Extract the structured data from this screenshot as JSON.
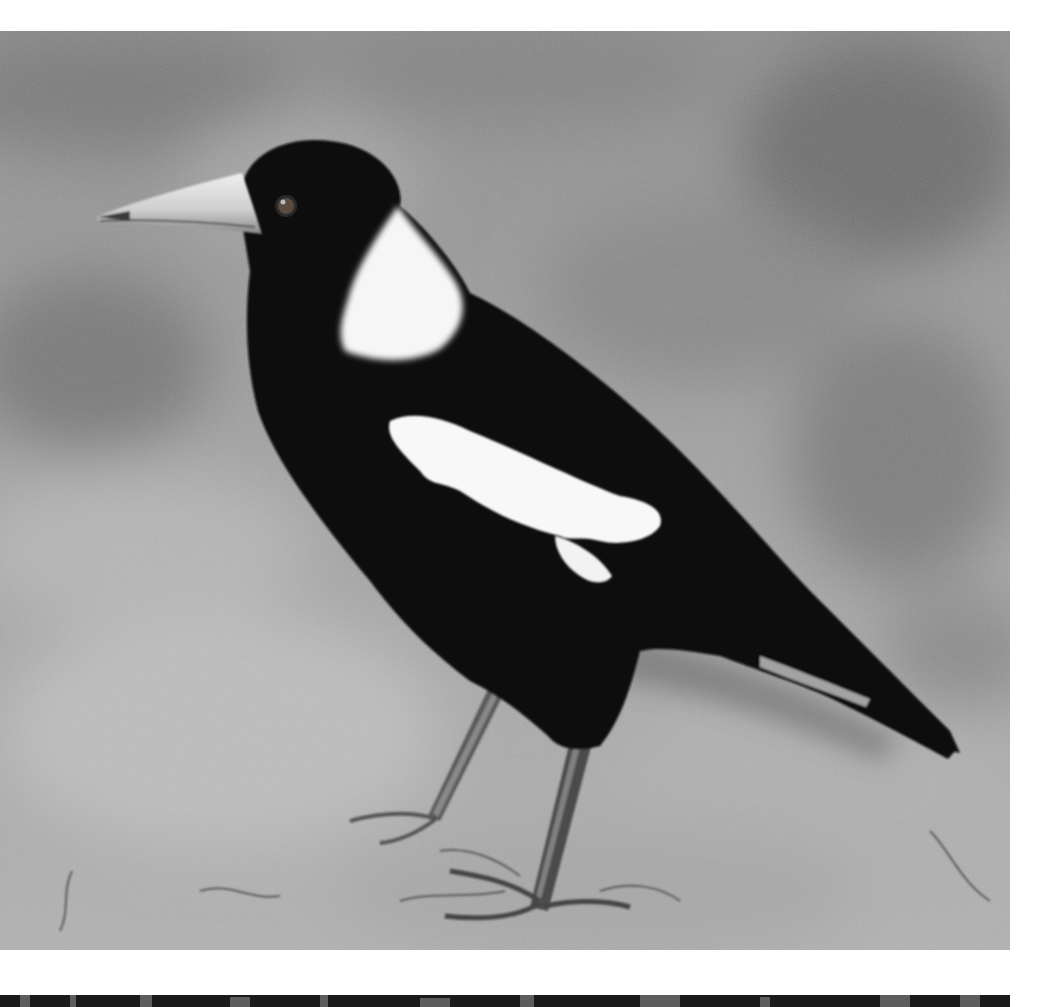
{
  "image": {
    "subject": "Australian magpie standing on dusty ground",
    "style": "black-and-white photograph",
    "colors": {
      "page_background": "#ffffff",
      "bird_black": "#0b0b0b",
      "bird_white": "#f6f6f6",
      "ground_light": "#b8b8b8",
      "ground_mid": "#9a9a9a",
      "ground_dark": "#6e6e6e",
      "beak": "#d8d8d8"
    },
    "regions": {
      "main_photo": {
        "x": 0,
        "y": 31,
        "width": 1010,
        "height": 919
      },
      "lower_photo_strip": {
        "x": 0,
        "y": 995,
        "width": 1010,
        "height": 12
      }
    }
  }
}
